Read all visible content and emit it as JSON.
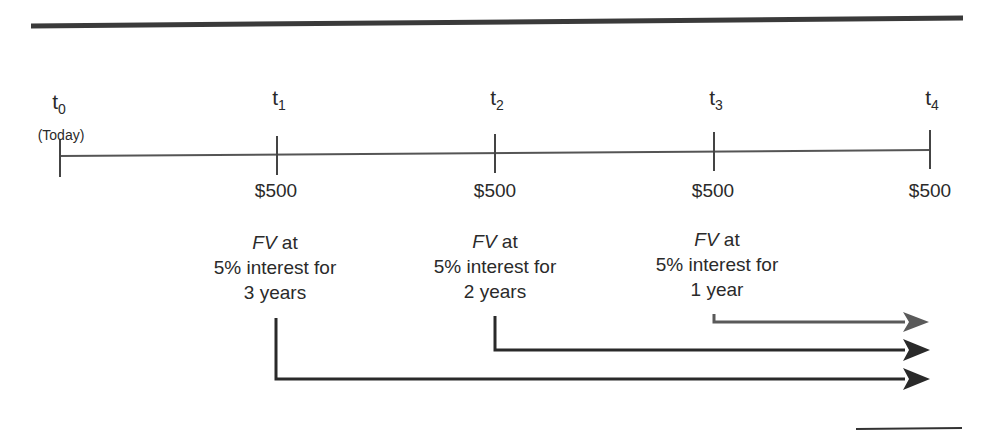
{
  "timeline": {
    "points": [
      {
        "id": "t0",
        "base": "t",
        "sub": "0",
        "note": "(Today)",
        "amount": ""
      },
      {
        "id": "t1",
        "base": "t",
        "sub": "1",
        "note": "",
        "amount": "$500"
      },
      {
        "id": "t2",
        "base": "t",
        "sub": "2",
        "note": "",
        "amount": "$500"
      },
      {
        "id": "t3",
        "base": "t",
        "sub": "3",
        "note": "",
        "amount": "$500"
      },
      {
        "id": "t4",
        "base": "t",
        "sub": "4",
        "note": "",
        "amount": "$500"
      }
    ]
  },
  "annotations": [
    {
      "fv": "FV",
      "at": " at",
      "line2": "5% interest for",
      "line3": "3 years"
    },
    {
      "fv": "FV",
      "at": " at",
      "line2": "5% interest for",
      "line3": "2 years"
    },
    {
      "fv": "FV",
      "at": " at",
      "line2": "5% interest for",
      "line3": "1 year"
    }
  ],
  "colors": {
    "rule": "#3a3a3a",
    "axis": "#555555",
    "arrow_dark": "#2a2a2a",
    "arrow_gray": "#5a5a5a"
  }
}
